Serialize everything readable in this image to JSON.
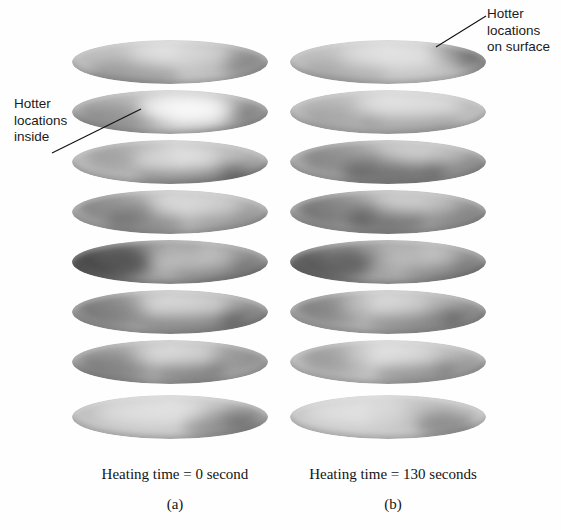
{
  "figure": {
    "kind": "thermal-tomography-slice-stacks",
    "background": "#ffffff",
    "annotations": [
      {
        "name": "hotter-locations-inside",
        "text": "Hotter\nlocations\ninside",
        "leader": {
          "x1": 52,
          "y1": 153,
          "x2": 141,
          "y2": 109
        }
      },
      {
        "name": "hotter-locations-on-surface",
        "text": "Hotter\nlocations\non surface",
        "leader": {
          "x1": 436,
          "y1": 47,
          "x2": 486,
          "y2": 16
        }
      }
    ],
    "panels": [
      {
        "id": "a",
        "caption": "Heating time = 0 second",
        "label": "(a)"
      },
      {
        "id": "b",
        "caption": "Heating time = 130 seconds",
        "label": "(b)"
      }
    ]
  },
  "chart_data": {
    "type": "heatmap",
    "title": "",
    "xlabel": "",
    "ylabel": "",
    "colormap": "grayscale",
    "legend_position": "none",
    "grid": false,
    "slices_per_stack": 8,
    "series": [
      {
        "name": "Heating time = 0 second",
        "panel": "(a)",
        "slices": [
          {
            "index": 1,
            "y": 40,
            "base": "#bdbdbd",
            "blobs": [
              {
                "cx": 62,
                "cy": 34,
                "rx": 46,
                "ry": 16,
                "c": "#8e8e8e",
                "o": 0.4
              },
              {
                "cx": 150,
                "cy": 14,
                "rx": 52,
                "ry": 14,
                "c": "#a0a0a0",
                "o": 0.34
              },
              {
                "cx": 176,
                "cy": 26,
                "rx": 26,
                "ry": 13,
                "c": "#7a7a7a",
                "o": 0.38
              }
            ],
            "hots": [
              {
                "cx": 108,
                "cy": 14,
                "rx": 52,
                "ry": 12,
                "c": "#efefef",
                "o": 0.48
              }
            ]
          },
          {
            "index": 2,
            "y": 90,
            "base": "#b4b4b4",
            "blobs": [
              {
                "cx": 44,
                "cy": 28,
                "rx": 42,
                "ry": 16,
                "c": "#8a8a8a",
                "o": 0.44
              },
              {
                "cx": 150,
                "cy": 30,
                "rx": 40,
                "ry": 15,
                "c": "#8f8f8f",
                "o": 0.36
              },
              {
                "cx": 186,
                "cy": 20,
                "rx": 22,
                "ry": 12,
                "c": "#7f7f7f",
                "o": 0.34
              }
            ],
            "hots": [
              {
                "cx": 112,
                "cy": 18,
                "rx": 46,
                "ry": 13,
                "c": "#ffffff",
                "o": 0.86
              },
              {
                "cx": 128,
                "cy": 26,
                "rx": 30,
                "ry": 11,
                "c": "#fbfbfb",
                "o": 0.7
              }
            ]
          },
          {
            "index": 3,
            "y": 140,
            "base": "#b8b8b8",
            "blobs": [
              {
                "cx": 60,
                "cy": 16,
                "rx": 44,
                "ry": 14,
                "c": "#909090",
                "o": 0.36
              },
              {
                "cx": 120,
                "cy": 36,
                "rx": 56,
                "ry": 12,
                "c": "#6f6f6f",
                "o": 0.52
              },
              {
                "cx": 178,
                "cy": 34,
                "rx": 30,
                "ry": 12,
                "c": "#787878",
                "o": 0.46
              }
            ],
            "hots": [
              {
                "cx": 104,
                "cy": 20,
                "rx": 44,
                "ry": 12,
                "c": "#f2f2f2",
                "o": 0.56
              }
            ]
          },
          {
            "index": 4,
            "y": 190,
            "base": "#b2b2b2",
            "blobs": [
              {
                "cx": 42,
                "cy": 18,
                "rx": 38,
                "ry": 16,
                "c": "#7d7d7d",
                "o": 0.48
              },
              {
                "cx": 74,
                "cy": 32,
                "rx": 40,
                "ry": 13,
                "c": "#6c6c6c",
                "o": 0.44
              },
              {
                "cx": 160,
                "cy": 30,
                "rx": 44,
                "ry": 13,
                "c": "#8a8a8a",
                "o": 0.34
              }
            ],
            "hots": [
              {
                "cx": 126,
                "cy": 16,
                "rx": 44,
                "ry": 12,
                "c": "#ebebeb",
                "o": 0.42
              }
            ]
          },
          {
            "index": 5,
            "y": 240,
            "base": "#9a9a9a",
            "blobs": [
              {
                "cx": 36,
                "cy": 22,
                "rx": 44,
                "ry": 18,
                "c": "#4a4a4a",
                "o": 0.72
              },
              {
                "cx": 86,
                "cy": 12,
                "rx": 46,
                "ry": 12,
                "c": "#5e5e5e",
                "o": 0.48
              },
              {
                "cx": 150,
                "cy": 30,
                "rx": 50,
                "ry": 14,
                "c": "#6a6a6a",
                "o": 0.38
              }
            ],
            "hots": [
              {
                "cx": 120,
                "cy": 20,
                "rx": 44,
                "ry": 12,
                "c": "#e4e4e4",
                "o": 0.46
              }
            ]
          },
          {
            "index": 6,
            "y": 290,
            "base": "#a9a9a9",
            "blobs": [
              {
                "cx": 40,
                "cy": 20,
                "rx": 38,
                "ry": 16,
                "c": "#707070",
                "o": 0.5
              },
              {
                "cx": 120,
                "cy": 32,
                "rx": 54,
                "ry": 12,
                "c": "#686868",
                "o": 0.46
              },
              {
                "cx": 176,
                "cy": 28,
                "rx": 30,
                "ry": 13,
                "c": "#747474",
                "o": 0.44
              }
            ],
            "hots": [
              {
                "cx": 110,
                "cy": 16,
                "rx": 48,
                "ry": 12,
                "c": "#eaeaea",
                "o": 0.44
              }
            ]
          },
          {
            "index": 7,
            "y": 340,
            "base": "#acacac",
            "blobs": [
              {
                "cx": 44,
                "cy": 26,
                "rx": 40,
                "ry": 16,
                "c": "#767676",
                "o": 0.48
              },
              {
                "cx": 118,
                "cy": 30,
                "rx": 36,
                "ry": 12,
                "c": "#5f5f5f",
                "o": 0.52
              },
              {
                "cx": 168,
                "cy": 18,
                "rx": 34,
                "ry": 13,
                "c": "#8a8a8a",
                "o": 0.32
              }
            ],
            "hots": [
              {
                "cx": 104,
                "cy": 16,
                "rx": 44,
                "ry": 12,
                "c": "#ededed",
                "o": 0.48
              }
            ]
          },
          {
            "index": 8,
            "y": 395,
            "base": "#c2c2c2",
            "blobs": [
              {
                "cx": 150,
                "cy": 30,
                "rx": 40,
                "ry": 14,
                "c": "#777777",
                "o": 0.52
              },
              {
                "cx": 176,
                "cy": 22,
                "rx": 26,
                "ry": 13,
                "c": "#8b8b8b",
                "o": 0.4
              }
            ],
            "hots": [
              {
                "cx": 80,
                "cy": 18,
                "rx": 56,
                "ry": 13,
                "c": "#f0f0f0",
                "o": 0.4
              }
            ]
          }
        ]
      },
      {
        "name": "Heating time = 130 seconds",
        "panel": "(b)",
        "slices": [
          {
            "index": 1,
            "y": 40,
            "base": "#bfbfbf",
            "blobs": [
              {
                "cx": 172,
                "cy": 12,
                "rx": 34,
                "ry": 11,
                "c": "#6e6e6e",
                "o": 0.52
              },
              {
                "cx": 190,
                "cy": 22,
                "rx": 22,
                "ry": 12,
                "c": "#7c7c7c",
                "o": 0.42
              },
              {
                "cx": 54,
                "cy": 32,
                "rx": 44,
                "ry": 15,
                "c": "#a2a2a2",
                "o": 0.3
              }
            ],
            "hots": [
              {
                "cx": 104,
                "cy": 16,
                "rx": 56,
                "ry": 13,
                "c": "#f1f1f1",
                "o": 0.44
              }
            ]
          },
          {
            "index": 2,
            "y": 90,
            "base": "#bcbcbc",
            "blobs": [
              {
                "cx": 120,
                "cy": 32,
                "rx": 50,
                "ry": 12,
                "c": "#8c8c8c",
                "o": 0.38
              },
              {
                "cx": 52,
                "cy": 26,
                "rx": 40,
                "ry": 15,
                "c": "#9b9b9b",
                "o": 0.32
              }
            ],
            "hots": [
              {
                "cx": 118,
                "cy": 16,
                "rx": 54,
                "ry": 13,
                "c": "#f4f4f4",
                "o": 0.48
              }
            ]
          },
          {
            "index": 3,
            "y": 140,
            "base": "#ababab",
            "blobs": [
              {
                "cx": 52,
                "cy": 18,
                "rx": 40,
                "ry": 15,
                "c": "#7b7b7b",
                "o": 0.46
              },
              {
                "cx": 104,
                "cy": 32,
                "rx": 52,
                "ry": 13,
                "c": "#585858",
                "o": 0.6
              },
              {
                "cx": 168,
                "cy": 26,
                "rx": 34,
                "ry": 13,
                "c": "#797979",
                "o": 0.42
              }
            ],
            "hots": [
              {
                "cx": 142,
                "cy": 14,
                "rx": 40,
                "ry": 11,
                "c": "#e6e6e6",
                "o": 0.36
              }
            ]
          },
          {
            "index": 4,
            "y": 190,
            "base": "#a6a6a6",
            "blobs": [
              {
                "cx": 46,
                "cy": 20,
                "rx": 40,
                "ry": 16,
                "c": "#6f6f6f",
                "o": 0.52
              },
              {
                "cx": 96,
                "cy": 30,
                "rx": 38,
                "ry": 13,
                "c": "#555555",
                "o": 0.56
              },
              {
                "cx": 162,
                "cy": 26,
                "rx": 40,
                "ry": 13,
                "c": "#7e7e7e",
                "o": 0.4
              }
            ],
            "hots": [
              {
                "cx": 130,
                "cy": 14,
                "rx": 40,
                "ry": 11,
                "c": "#e9e9e9",
                "o": 0.36
              }
            ]
          },
          {
            "index": 5,
            "y": 240,
            "base": "#9e9e9e",
            "blobs": [
              {
                "cx": 38,
                "cy": 24,
                "rx": 44,
                "ry": 17,
                "c": "#565656",
                "o": 0.64
              },
              {
                "cx": 92,
                "cy": 14,
                "rx": 44,
                "ry": 12,
                "c": "#676767",
                "o": 0.46
              },
              {
                "cx": 160,
                "cy": 30,
                "rx": 46,
                "ry": 13,
                "c": "#707070",
                "o": 0.4
              }
            ],
            "hots": [
              {
                "cx": 128,
                "cy": 18,
                "rx": 40,
                "ry": 12,
                "c": "#e8e8e8",
                "o": 0.42
              }
            ]
          },
          {
            "index": 6,
            "y": 290,
            "base": "#adadad",
            "blobs": [
              {
                "cx": 44,
                "cy": 18,
                "rx": 40,
                "ry": 15,
                "c": "#757575",
                "o": 0.48
              },
              {
                "cx": 126,
                "cy": 30,
                "rx": 48,
                "ry": 13,
                "c": "#696969",
                "o": 0.46
              },
              {
                "cx": 180,
                "cy": 26,
                "rx": 28,
                "ry": 13,
                "c": "#767676",
                "o": 0.42
              }
            ],
            "hots": [
              {
                "cx": 96,
                "cy": 16,
                "rx": 46,
                "ry": 12,
                "c": "#ededed",
                "o": 0.44
              }
            ]
          },
          {
            "index": 7,
            "y": 340,
            "base": "#bdbdbd",
            "blobs": [
              {
                "cx": 48,
                "cy": 18,
                "rx": 36,
                "ry": 14,
                "c": "#838383",
                "o": 0.4
              },
              {
                "cx": 124,
                "cy": 32,
                "rx": 40,
                "ry": 12,
                "c": "#6d6d6d",
                "o": 0.46
              },
              {
                "cx": 176,
                "cy": 28,
                "rx": 28,
                "ry": 12,
                "c": "#7e7e7e",
                "o": 0.38
              }
            ],
            "hots": [
              {
                "cx": 100,
                "cy": 16,
                "rx": 46,
                "ry": 12,
                "c": "#f0f0f0",
                "o": 0.44
              }
            ]
          },
          {
            "index": 8,
            "y": 395,
            "base": "#c6c6c6",
            "blobs": [
              {
                "cx": 156,
                "cy": 30,
                "rx": 30,
                "ry": 13,
                "c": "#787878",
                "o": 0.52
              },
              {
                "cx": 120,
                "cy": 18,
                "rx": 44,
                "ry": 13,
                "c": "#a6a6a6",
                "o": 0.3
              }
            ],
            "hots": [
              {
                "cx": 66,
                "cy": 18,
                "rx": 54,
                "ry": 13,
                "c": "#f2f2f2",
                "o": 0.4
              }
            ]
          }
        ]
      }
    ]
  }
}
